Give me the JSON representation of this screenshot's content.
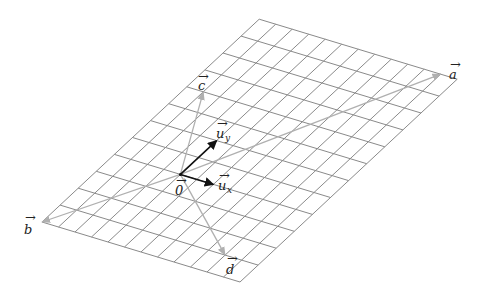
{
  "diagram": {
    "title": "",
    "grid": {
      "cells_x": 12,
      "cells_y": 12,
      "origin_cell": [
        4,
        4
      ],
      "corner_left": [
        42,
        222
      ],
      "unit_x_px": [
        16.5,
        5
      ],
      "unit_y_px": [
        18.1,
        -16.9
      ],
      "line_color": "#8a8a8a"
    },
    "colors": {
      "basis": "#111111",
      "vectors": "#b0b0b0",
      "background": "#ffffff"
    },
    "basis_vectors": [
      {
        "name": "u_x",
        "label": "u",
        "subscript": "x",
        "coords": [
          2,
          0
        ]
      },
      {
        "name": "u_y",
        "label": "u",
        "subscript": "y",
        "coords": [
          0,
          2
        ]
      }
    ],
    "vectors": [
      {
        "name": "a",
        "label": "a",
        "coords": [
          7,
          8
        ]
      },
      {
        "name": "b",
        "label": "b",
        "coords": [
          -4,
          -4
        ]
      },
      {
        "name": "c",
        "label": "c",
        "coords": [
          -3,
          4
        ]
      },
      {
        "name": "d",
        "label": "d",
        "coords": [
          6,
          -3
        ]
      }
    ],
    "origin_label": "0",
    "labels": {
      "a": "a",
      "b": "b",
      "c": "c",
      "d": "d",
      "ux_main": "u",
      "ux_sub": "x",
      "uy_main": "u",
      "uy_sub": "y",
      "zero": "0",
      "arrow": "→"
    }
  }
}
